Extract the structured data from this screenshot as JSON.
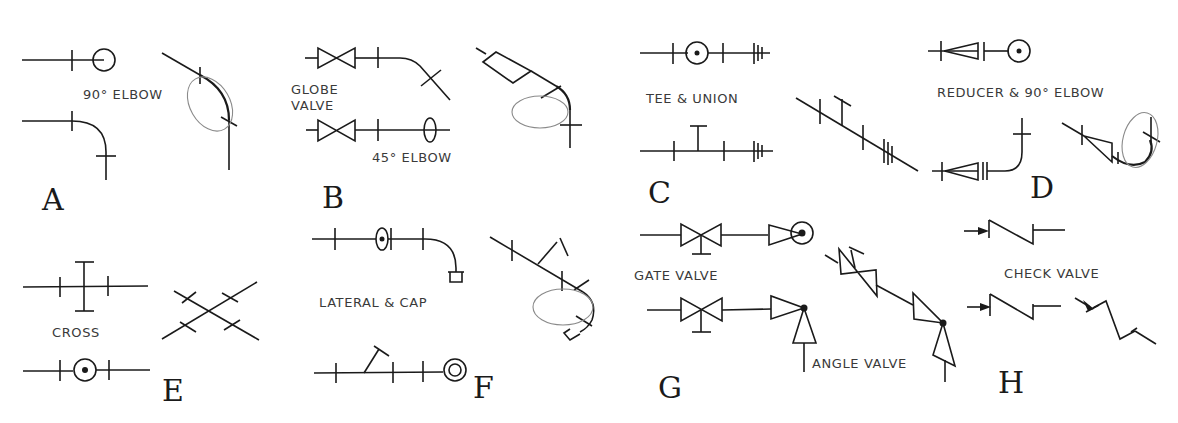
{
  "figure": {
    "panels": [
      {
        "id": "A",
        "letter": "A",
        "label": "90° ELBOW"
      },
      {
        "id": "B",
        "letter": "B",
        "label_line1": "GLOBE",
        "label_line2": "VALVE",
        "label2": "45° ELBOW"
      },
      {
        "id": "C",
        "letter": "C",
        "label": "TEE & UNION"
      },
      {
        "id": "D",
        "letter": "D",
        "label": "REDUCER & 90° ELBOW"
      },
      {
        "id": "E",
        "letter": "E",
        "label": "CROSS"
      },
      {
        "id": "F",
        "letter": "F",
        "label": "LATERAL & CAP"
      },
      {
        "id": "G",
        "letter": "G",
        "label": "GATE VALVE",
        "label2": "ANGLE VALVE"
      },
      {
        "id": "H",
        "letter": "H",
        "label": "CHECK VALVE"
      }
    ]
  },
  "colors": {
    "ink": "#1a1a1a",
    "ellipse": "#8a8a8a",
    "label": "#3a3a3a",
    "background": "#ffffff"
  }
}
